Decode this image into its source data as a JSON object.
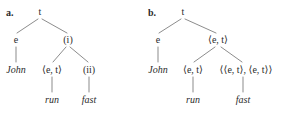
{
  "figure": {
    "background_color": "#ffffff",
    "ink_color": "#2b2b2b",
    "line_color": "#5a5a5a"
  },
  "trees": [
    {
      "id": "tree-a",
      "panel_label": "a.",
      "nodes": [
        {
          "name": "root",
          "label": "t",
          "style": "type",
          "x": 40,
          "y": 12
        },
        {
          "name": "left-daughter",
          "label": "e",
          "style": "type",
          "x": 16,
          "y": 40
        },
        {
          "name": "right-daughter",
          "label": "(i)",
          "style": "type",
          "x": 68,
          "y": 40
        },
        {
          "name": "leaf-john",
          "label": "John",
          "style": "italic",
          "x": 16,
          "y": 70
        },
        {
          "name": "run-type",
          "label": "⟨e, t⟩",
          "style": "type",
          "x": 52,
          "y": 70
        },
        {
          "name": "fast-type",
          "label": "(ii)",
          "style": "type",
          "x": 89,
          "y": 70
        },
        {
          "name": "leaf-run",
          "label": "run",
          "style": "italic",
          "x": 52,
          "y": 100
        },
        {
          "name": "leaf-fast",
          "label": "fast",
          "style": "italic",
          "x": 89,
          "y": 100
        }
      ],
      "edges": [
        {
          "name": "root-to-e",
          "x1": 38,
          "y1": 19,
          "x2": 17,
          "y2": 33
        },
        {
          "name": "root-to-i",
          "x1": 42,
          "y1": 19,
          "x2": 67,
          "y2": 33
        },
        {
          "name": "e-to-john",
          "x1": 16,
          "y1": 47,
          "x2": 16,
          "y2": 62
        },
        {
          "name": "i-to-run-type",
          "x1": 66,
          "y1": 47,
          "x2": 53,
          "y2": 62
        },
        {
          "name": "i-to-fast-type",
          "x1": 70,
          "y1": 47,
          "x2": 88,
          "y2": 62
        },
        {
          "name": "run-type-to-run",
          "x1": 52,
          "y1": 77,
          "x2": 52,
          "y2": 92
        },
        {
          "name": "fast-type-to-fast",
          "x1": 89,
          "y1": 77,
          "x2": 89,
          "y2": 92
        }
      ]
    },
    {
      "id": "tree-b",
      "panel_label": "b.",
      "nodes": [
        {
          "name": "root",
          "label": "t",
          "style": "type",
          "x": 41,
          "y": 12
        },
        {
          "name": "left-daughter",
          "label": "e",
          "style": "type",
          "x": 16,
          "y": 40
        },
        {
          "name": "right-daughter",
          "label": "⟨e, t⟩",
          "style": "type",
          "x": 76,
          "y": 40
        },
        {
          "name": "leaf-john",
          "label": "John",
          "style": "italic",
          "x": 16,
          "y": 70
        },
        {
          "name": "run-type",
          "label": "⟨e, t⟩",
          "style": "type",
          "x": 51,
          "y": 70
        },
        {
          "name": "fast-type",
          "label": "⟨⟨e, t⟩, ⟨e, t⟩⟩",
          "style": "type",
          "x": 104,
          "y": 70
        },
        {
          "name": "leaf-run",
          "label": "run",
          "style": "italic",
          "x": 51,
          "y": 100
        },
        {
          "name": "leaf-fast",
          "label": "fast",
          "style": "italic",
          "x": 101,
          "y": 100
        }
      ],
      "edges": [
        {
          "name": "root-to-e",
          "x1": 39,
          "y1": 19,
          "x2": 17,
          "y2": 33
        },
        {
          "name": "root-to-et",
          "x1": 43,
          "y1": 19,
          "x2": 74,
          "y2": 33
        },
        {
          "name": "e-to-john",
          "x1": 16,
          "y1": 47,
          "x2": 16,
          "y2": 62
        },
        {
          "name": "et-to-run-type",
          "x1": 73,
          "y1": 47,
          "x2": 52,
          "y2": 62
        },
        {
          "name": "et-to-fast-type",
          "x1": 79,
          "y1": 47,
          "x2": 100,
          "y2": 62
        },
        {
          "name": "run-type-to-run",
          "x1": 51,
          "y1": 77,
          "x2": 51,
          "y2": 92
        },
        {
          "name": "fast-type-to-fast",
          "x1": 101,
          "y1": 77,
          "x2": 101,
          "y2": 92
        }
      ]
    }
  ]
}
